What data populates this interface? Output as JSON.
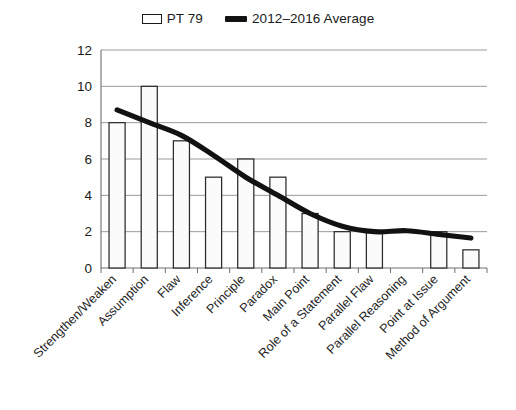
{
  "legend": {
    "entries": [
      {
        "label": "PT 79",
        "marker": "bar-swatch-icon",
        "color": "#ffffff"
      },
      {
        "label": "2012–2016 Average",
        "marker": "line-swatch-icon",
        "color": "#121212"
      }
    ]
  },
  "axis": {
    "y_ticks": [
      "0",
      "2",
      "4",
      "6",
      "8",
      "10",
      "12"
    ]
  },
  "chart_data": {
    "type": "bar",
    "title": "",
    "xlabel": "",
    "ylabel": "",
    "ylim": [
      0,
      12
    ],
    "ytick_step": 2,
    "grid": true,
    "legend_position": "top-center",
    "categories": [
      "Strengthen/Weaken",
      "Assumption",
      "Flaw",
      "Inference",
      "Principle",
      "Paradox",
      "Main Point",
      "Role of a Statement",
      "Parallel Flaw",
      "Parallel Reasoning",
      "Point at Issue",
      "Method of Argument"
    ],
    "series": [
      {
        "name": "PT 79",
        "type": "bar",
        "values": [
          8,
          10,
          7,
          5,
          6,
          5,
          3,
          2,
          2,
          0,
          2,
          1
        ]
      },
      {
        "name": "2012–2016 Average",
        "type": "line",
        "values": [
          8.7,
          8.0,
          7.3,
          6.2,
          5.0,
          4.0,
          3.0,
          2.3,
          2.0,
          2.05,
          1.85,
          1.65
        ]
      }
    ]
  }
}
